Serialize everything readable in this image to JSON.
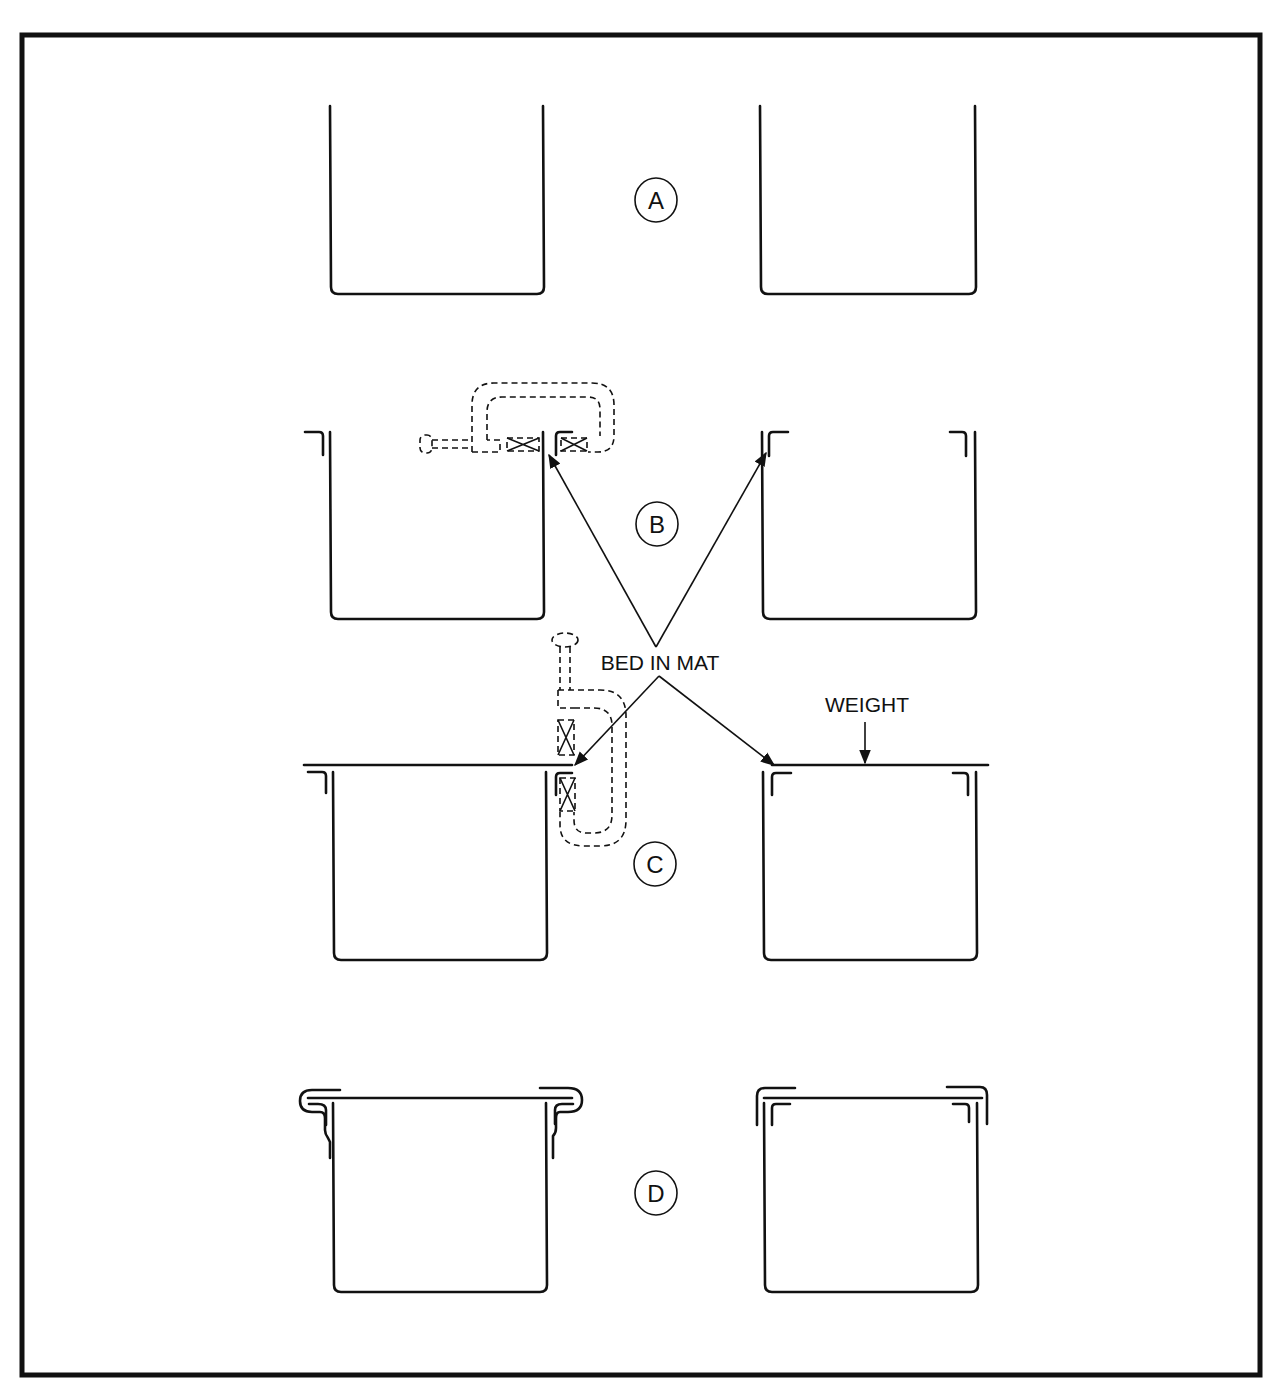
{
  "figure": {
    "stages": [
      {
        "id": "A",
        "label": "A"
      },
      {
        "id": "B",
        "label": "B"
      },
      {
        "id": "C",
        "label": "C"
      },
      {
        "id": "D",
        "label": "D"
      }
    ],
    "callouts": {
      "bed_in_mat": "BED IN MAT",
      "weight": "WEIGHT"
    },
    "colors": {
      "ink": "#111111",
      "paper": "#ffffff"
    }
  }
}
